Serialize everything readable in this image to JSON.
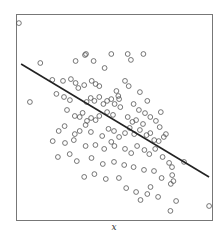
{
  "chart_data": {
    "type": "scatter",
    "title": "",
    "xlabel": "x",
    "ylabel": "",
    "xlim": [
      0,
      100
    ],
    "ylim": [
      0,
      100
    ],
    "grid": false,
    "legend": null,
    "frame": {
      "left": 16,
      "top": 14,
      "right": 212,
      "bottom": 220
    },
    "colors": {
      "frame": "#777777",
      "point": "#555555",
      "line": "#222222"
    },
    "regression_line": {
      "x": [
        2.6,
        98.5
      ],
      "y": [
        75.7,
        20.9
      ],
      "note": "descending least-squares fit line"
    },
    "points": [
      [
        1.5,
        95.6
      ],
      [
        7.1,
        57.3
      ],
      [
        12.4,
        76.2
      ],
      [
        30.4,
        77.2
      ],
      [
        35.2,
        80.1
      ],
      [
        35.7,
        80.6
      ],
      [
        39.6,
        77.2
      ],
      [
        45.2,
        73.8
      ],
      [
        48.6,
        80.6
      ],
      [
        57.0,
        80.6
      ],
      [
        58.6,
        77.7
      ],
      [
        65.0,
        80.6
      ],
      [
        18.5,
        68.0
      ],
      [
        24.0,
        67.5
      ],
      [
        28.0,
        68.4
      ],
      [
        30.4,
        66.5
      ],
      [
        31.8,
        64.1
      ],
      [
        34.8,
        65.5
      ],
      [
        38.6,
        67.5
      ],
      [
        40.6,
        66.0
      ],
      [
        42.5,
        65.0
      ],
      [
        51.2,
        62.6
      ],
      [
        52.2,
        60.2
      ],
      [
        55.6,
        67.5
      ],
      [
        57.5,
        65.0
      ],
      [
        63.2,
        62.1
      ],
      [
        67.0,
        57.8
      ],
      [
        20.6,
        61.2
      ],
      [
        24.5,
        59.7
      ],
      [
        27.5,
        58.2
      ],
      [
        36.0,
        57.3
      ],
      [
        38.1,
        59.2
      ],
      [
        40.0,
        57.8
      ],
      [
        42.5,
        59.7
      ],
      [
        44.6,
        56.3
      ],
      [
        46.5,
        57.8
      ],
      [
        48.6,
        58.7
      ],
      [
        50.3,
        56.3
      ],
      [
        52.6,
        58.7
      ],
      [
        53.2,
        54.8
      ],
      [
        60.0,
        56.3
      ],
      [
        62.7,
        53.4
      ],
      [
        65.8,
        51.9
      ],
      [
        73.9,
        52.4
      ],
      [
        26.0,
        53.4
      ],
      [
        30.0,
        50.5
      ],
      [
        32.5,
        50.0
      ],
      [
        34.0,
        52.0
      ],
      [
        36.2,
        48.1
      ],
      [
        38.3,
        49.5
      ],
      [
        40.6,
        48.5
      ],
      [
        42.5,
        50.5
      ],
      [
        46.5,
        52.4
      ],
      [
        49.5,
        51.0
      ],
      [
        57.0,
        50.0
      ],
      [
        59.4,
        47.6
      ],
      [
        61.3,
        48.5
      ],
      [
        64.8,
        46.6
      ],
      [
        68.5,
        50.0
      ],
      [
        71.4,
        48.1
      ],
      [
        73.3,
        45.1
      ],
      [
        76.5,
        41.7
      ],
      [
        21.8,
        43.2
      ],
      [
        24.8,
        45.6
      ],
      [
        30.0,
        41.7
      ],
      [
        32.5,
        43.2
      ],
      [
        35.5,
        46.1
      ],
      [
        38.2,
        42.7
      ],
      [
        44.0,
        40.8
      ],
      [
        47.2,
        44.2
      ],
      [
        50.0,
        43.2
      ],
      [
        52.6,
        40.3
      ],
      [
        55.6,
        42.2
      ],
      [
        58.0,
        44.7
      ],
      [
        60.3,
        41.7
      ],
      [
        63.2,
        43.7
      ],
      [
        66.6,
        41.2
      ],
      [
        68.5,
        42.2
      ],
      [
        70.5,
        38.8
      ],
      [
        72.8,
        38.3
      ],
      [
        75.4,
        40.3
      ],
      [
        18.7,
        38.3
      ],
      [
        25.0,
        37.4
      ],
      [
        29.5,
        38.8
      ],
      [
        35.5,
        35.9
      ],
      [
        40.5,
        36.4
      ],
      [
        45.0,
        34.5
      ],
      [
        48.6,
        37.9
      ],
      [
        50.2,
        35.9
      ],
      [
        55.6,
        34.5
      ],
      [
        58.8,
        32.5
      ],
      [
        61.8,
        35.9
      ],
      [
        65.5,
        34.0
      ],
      [
        68.0,
        32.0
      ],
      [
        71.0,
        34.5
      ],
      [
        74.8,
        30.6
      ],
      [
        78.1,
        27.7
      ],
      [
        79.6,
        25.7
      ],
      [
        85.7,
        28.2
      ],
      [
        21.4,
        30.6
      ],
      [
        27.4,
        32.0
      ],
      [
        31.0,
        28.6
      ],
      [
        38.5,
        30.1
      ],
      [
        44.3,
        27.2
      ],
      [
        50.0,
        28.2
      ],
      [
        55.2,
        26.7
      ],
      [
        60.0,
        25.7
      ],
      [
        65.3,
        24.3
      ],
      [
        70.4,
        23.8
      ],
      [
        74.3,
        20.4
      ],
      [
        79.7,
        21.8
      ],
      [
        34.8,
        20.9
      ],
      [
        40.0,
        22.3
      ],
      [
        45.8,
        19.9
      ],
      [
        52.5,
        20.4
      ],
      [
        56.2,
        15.5
      ],
      [
        61.3,
        13.6
      ],
      [
        67.0,
        12.6
      ],
      [
        72.5,
        11.2
      ],
      [
        79.0,
        17.5
      ],
      [
        80.3,
        18.9
      ],
      [
        78.8,
        4.4
      ],
      [
        81.7,
        9.2
      ],
      [
        98.5,
        6.8
      ],
      [
        63.5,
        9.7
      ],
      [
        68.6,
        16.0
      ]
    ]
  },
  "axis": {
    "x_label": "x"
  }
}
